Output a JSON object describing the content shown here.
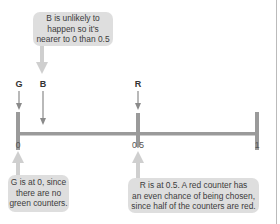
{
  "number_line": {
    "min_label": "0",
    "mid_label": "0.5",
    "max_label": "1",
    "line_color": "#999999"
  },
  "markers": [
    {
      "label": "G",
      "value": 0
    },
    {
      "label": "B",
      "value": 0.1
    },
    {
      "label": "R",
      "value": 0.5
    }
  ],
  "callouts": {
    "b_note": {
      "lines": [
        "B is unlikely to",
        "happen so it's",
        "nearer to 0 than 0.5"
      ]
    },
    "g_note": {
      "lines": [
        "G is at 0, since",
        "there are no",
        "green counters."
      ]
    },
    "r_note": {
      "lines": [
        "R is at 0.5. A red counter has",
        "an even chance of being chosen,",
        "since half of the counters are red."
      ]
    }
  },
  "colors": {
    "callout_bg": "#dedede",
    "arrow": "#c8c8c8",
    "marker_arrow": "#8a8a8a"
  }
}
